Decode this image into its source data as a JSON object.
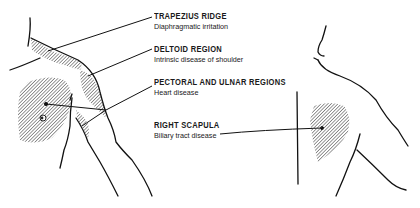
{
  "diagram": {
    "type": "referred-pain-map",
    "views": [
      "anterior-left-shoulder-arm",
      "posterior-right-shoulder"
    ],
    "hatch_color": "#555555",
    "line_color": "#111111",
    "labels": [
      {
        "id": "trapezius",
        "title": "TRAPEZIUS RIDGE",
        "subtitle": "Diaphragmatic irritation"
      },
      {
        "id": "deltoid",
        "title": "DELTOID REGION",
        "subtitle": "Intrinsic disease of shoulder"
      },
      {
        "id": "pectoral",
        "title": "PECTORAL AND ULNAR REGIONS",
        "subtitle": "Heart disease"
      },
      {
        "id": "scapula",
        "title": "RIGHT SCAPULA",
        "subtitle": "Biliary tract disease"
      }
    ]
  }
}
